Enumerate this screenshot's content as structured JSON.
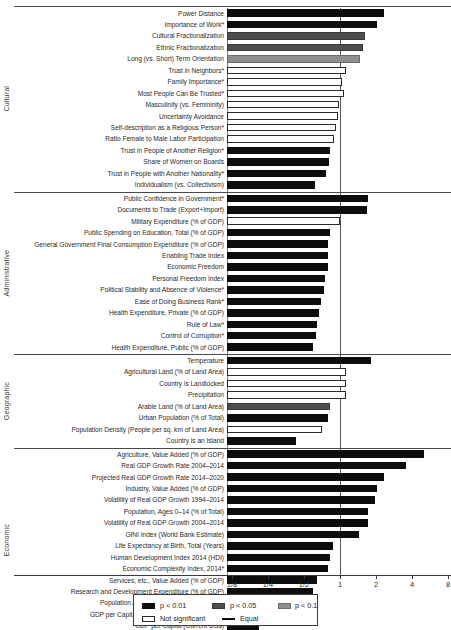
{
  "chart_data": {
    "type": "bar",
    "title": "",
    "xlabel": "",
    "ylabel": "",
    "orientation": "horizontal",
    "xscale": "log2",
    "xlim": [
      0.125,
      8
    ],
    "grid": false,
    "equal_value": 1,
    "tick_labels": [
      "1/8",
      "1/4",
      "1/2",
      "1",
      "2",
      "4",
      "8"
    ],
    "tick_values": [
      0.125,
      0.25,
      0.5,
      1,
      2,
      4,
      8
    ],
    "legend": {
      "position": "bottom",
      "entries": [
        {
          "label": "p < 0.01",
          "key": "p01",
          "color": "#0d0d0d"
        },
        {
          "label": "p < 0.05",
          "key": "p05",
          "color": "#4d4d4d"
        },
        {
          "label": "p < 0.1",
          "key": "p10",
          "color": "#8f8f8f"
        },
        {
          "label": "Not significant",
          "key": "ns",
          "color": "#ffffff"
        },
        {
          "label": "Equal",
          "key": "eq",
          "color": "#0d0d0d"
        }
      ]
    },
    "groups": [
      {
        "name": "Cultural",
        "items": [
          {
            "label": "Power Distance",
            "value": 2.35,
            "sig": "p01"
          },
          {
            "label": "Importance of Work*",
            "value": 2.05,
            "sig": "p01"
          },
          {
            "label": "Cultural Fractionalization",
            "value": 1.62,
            "sig": "p05"
          },
          {
            "label": "Ethnic Fractionalization",
            "value": 1.56,
            "sig": "p05"
          },
          {
            "label": "Long (vs. Short) Term Orientation",
            "value": 1.46,
            "sig": "p10"
          },
          {
            "label": "Trust in Neighbors*",
            "value": 1.13,
            "sig": "ns"
          },
          {
            "label": "Family Importance*",
            "value": 1.03,
            "sig": "ns"
          },
          {
            "label": "Most People Can Be Trusted*",
            "value": 1.08,
            "sig": "ns"
          },
          {
            "label": "Masculinity (vs. Femininity)",
            "value": 0.99,
            "sig": "ns"
          },
          {
            "label": "Uncertainty Avoidance",
            "value": 0.96,
            "sig": "ns"
          },
          {
            "label": "Self-description as a Religious Person*",
            "value": 0.93,
            "sig": "ns"
          },
          {
            "label": "Ratio Female to Male Labor Participation",
            "value": 0.89,
            "sig": "ns"
          },
          {
            "label": "Trust in People of Another Religion*",
            "value": 0.83,
            "sig": "p01"
          },
          {
            "label": "Share of Women on Boards",
            "value": 0.81,
            "sig": "p01"
          },
          {
            "label": "Trust in People with Another Nationality*",
            "value": 0.76,
            "sig": "p01"
          },
          {
            "label": "Individualism (vs. Collectivism)",
            "value": 0.62,
            "sig": "p01"
          }
        ]
      },
      {
        "name": "Administrative",
        "items": [
          {
            "label": "Public Confidence in Government*",
            "value": 1.7,
            "sig": "p01"
          },
          {
            "label": "Documents to Trade (Export+Import)",
            "value": 1.68,
            "sig": "p01"
          },
          {
            "label": "Military Expenditure (% of GDP)",
            "value": 1.0,
            "sig": "ns"
          },
          {
            "label": "Public Spending on Education, Total (% of GDP)",
            "value": 0.82,
            "sig": "p01"
          },
          {
            "label": "General Government Final Consumption Expenditure (% of GDP)",
            "value": 0.8,
            "sig": "p01"
          },
          {
            "label": "Enabling Trade Index",
            "value": 0.8,
            "sig": "p01"
          },
          {
            "label": "Economic Freedom",
            "value": 0.79,
            "sig": "p01"
          },
          {
            "label": "Personal Freedom Index",
            "value": 0.75,
            "sig": "p01"
          },
          {
            "label": "Political Stability and Absence of Violence*",
            "value": 0.73,
            "sig": "p01"
          },
          {
            "label": "Ease of Doing Business Rank*",
            "value": 0.7,
            "sig": "p01"
          },
          {
            "label": "Health Expenditure, Private (% of GDP)",
            "value": 0.67,
            "sig": "p01"
          },
          {
            "label": "Rule of Law*",
            "value": 0.64,
            "sig": "p01"
          },
          {
            "label": "Control of Corruption*",
            "value": 0.63,
            "sig": "p01"
          },
          {
            "label": "Health Expenditure, Public (% of GDP)",
            "value": 0.59,
            "sig": "p01"
          }
        ]
      },
      {
        "name": "Geographic",
        "items": [
          {
            "label": "Temperature",
            "value": 1.83,
            "sig": "p01"
          },
          {
            "label": "Agricultural Land (% of Land Area)",
            "value": 1.13,
            "sig": "ns"
          },
          {
            "label": "Country is Landlocked",
            "value": 1.12,
            "sig": "ns"
          },
          {
            "label": "Precipitation",
            "value": 1.13,
            "sig": "ns"
          },
          {
            "label": "Arable Land (% of Land Area)",
            "value": 0.82,
            "sig": "p05"
          },
          {
            "label": "Urban Population (% of Total)",
            "value": 0.79,
            "sig": "p01"
          },
          {
            "label": "Population Density (People per sq. km of Land Area)",
            "value": 0.71,
            "sig": "ns"
          },
          {
            "label": "Country is an Island",
            "value": 0.43,
            "sig": "p01"
          }
        ]
      },
      {
        "name": "Economic",
        "items": [
          {
            "label": "Agriculture, Value Added (% of GDP)",
            "value": 5.0,
            "sig": "p01"
          },
          {
            "label": "Real GDP Growth Rate 2004–2014",
            "value": 3.55,
            "sig": "p01"
          },
          {
            "label": "Projected Real GDP Growth Rate 2014–2020",
            "value": 2.35,
            "sig": "p01"
          },
          {
            "label": "Industry, Value Added (% of GDP)",
            "value": 2.05,
            "sig": "p01"
          },
          {
            "label": "Volatility of Real GDP Growth 1994–2014",
            "value": 1.95,
            "sig": "p01"
          },
          {
            "label": "Population, Ages 0–14 (% of Total)",
            "value": 1.73,
            "sig": "p01"
          },
          {
            "label": "Volatility of Real GDP Growth 2004–2014",
            "value": 1.7,
            "sig": "p01"
          },
          {
            "label": "GINI Index (World Bank Estimate)",
            "value": 1.45,
            "sig": "p01"
          },
          {
            "label": "Life Expectancy at Birth, Total (Years)",
            "value": 0.88,
            "sig": "p01"
          },
          {
            "label": "Human Development Index 2014 (HDI)",
            "value": 0.82,
            "sig": "p01"
          },
          {
            "label": "Economic Complexity Index, 2014*",
            "value": 0.8,
            "sig": "p01"
          },
          {
            "label": "Services, etc., Value Added (% of GDP)",
            "value": 0.64,
            "sig": "p01"
          },
          {
            "label": "Research and Development Expenditure (% of GDP)",
            "value": 0.6,
            "sig": "p01"
          },
          {
            "label": "Population Ages 65 and Above (% of Total)",
            "value": 0.5,
            "sig": "p01"
          },
          {
            "label": "GDP per Capita, PPP (Current International $)",
            "value": 0.33,
            "sig": "p01"
          },
          {
            "label": "GDP per Capita (Current US$)",
            "value": 0.21,
            "sig": "p01"
          }
        ]
      }
    ]
  }
}
